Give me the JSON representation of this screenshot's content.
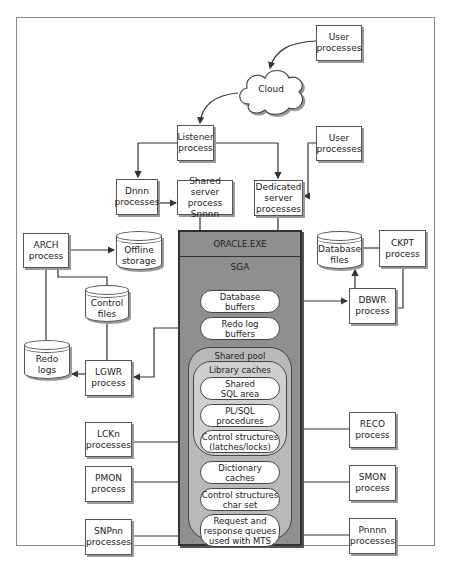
{
  "diagram": {
    "nodes": {
      "user_processes_top": "User\nprocesses",
      "cloud": "Cloud",
      "listener": "Listener\nprocess",
      "user_processes_right": "User\nprocesses",
      "dnnn": "Dnnn\nprocesses",
      "shared_server": "Shared server\nprocess\nSnnnn",
      "dedicated_server": "Dedicated\nserver\nprocesses",
      "arch": "ARCH\nprocess",
      "offline_storage": "Offline\nstorage",
      "database_files": "Database\nfiles",
      "ckpt": "CKPT\nprocess",
      "control_files": "Control\nfiles",
      "dbwr": "DBWR\nprocess",
      "redo_logs": "Redo\nlogs",
      "lgwr": "LGWR\nprocess",
      "lckn": "LCKn\nprocesses",
      "reco": "RECO\nprocess",
      "pmon": "PMON\nprocess",
      "smon": "SMON\nprocess",
      "snpnn": "SNPnn\nprocesses",
      "pnnnn": "Pnnnn\nprocesses"
    },
    "oracle_exe": {
      "title": "ORACLE.EXE",
      "sga_label": "SGA",
      "database_buffers": "Database\nbuffers",
      "redo_log_buffers": "Redo log\nbuffers",
      "shared_pool": {
        "label": "Shared pool",
        "library_caches": {
          "label": "Library caches",
          "items": [
            "Shared\nSQL area",
            "PL/SQL\nprocedures",
            "Control structures\n(latches/locks)"
          ]
        },
        "dictionary_caches": "Dictionary\ncaches",
        "control_structures_charset": "Control structures\nchar set",
        "request_response_queues": "Request and\nresponse queues\nused with MTS"
      }
    },
    "colors": {
      "oracle_box": "#8f8f8f",
      "shared_pool": "#b8b8b8",
      "library_caches": "#cfcfcf",
      "box_fill": "#ffffff",
      "line": "#333333"
    }
  }
}
